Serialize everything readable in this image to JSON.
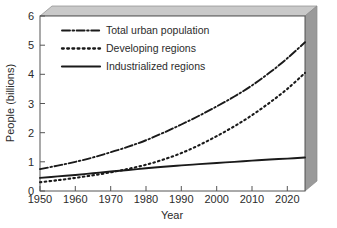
{
  "chart_data": {
    "type": "line",
    "title": "",
    "xlabel": "Year",
    "ylabel": "People (billions)",
    "xlim": [
      1950,
      2025
    ],
    "ylim": [
      0,
      6
    ],
    "xticks": [
      1950,
      1960,
      1970,
      1980,
      1990,
      2000,
      2010,
      2020
    ],
    "xtick_labels": [
      "1950",
      "1960",
      "1970",
      "1980",
      "1990",
      "2000",
      "2010",
      "2020"
    ],
    "yticks": [
      0,
      1,
      2,
      3,
      4,
      5,
      6
    ],
    "ytick_labels": [
      "0",
      "1",
      "2",
      "3",
      "4",
      "5",
      "6"
    ],
    "grid": false,
    "legend_position": "upper-left-inside",
    "x": [
      1950,
      1955,
      1960,
      1965,
      1970,
      1975,
      1980,
      1985,
      1990,
      1995,
      2000,
      2005,
      2010,
      2015,
      2020,
      2025
    ],
    "series": [
      {
        "name": "Total urban population",
        "style": "dash-dot",
        "color": "#1a1a1a",
        "values": [
          0.75,
          0.87,
          1.0,
          1.15,
          1.33,
          1.52,
          1.74,
          2.0,
          2.28,
          2.58,
          2.9,
          3.24,
          3.62,
          4.06,
          4.55,
          5.1
        ]
      },
      {
        "name": "Developing regions",
        "style": "dotted",
        "color": "#1a1a1a",
        "values": [
          0.3,
          0.37,
          0.45,
          0.54,
          0.64,
          0.76,
          0.9,
          1.08,
          1.3,
          1.57,
          1.88,
          2.22,
          2.6,
          3.03,
          3.5,
          4.05
        ]
      },
      {
        "name": "Industrialized regions",
        "style": "solid",
        "color": "#1a1a1a",
        "values": [
          0.45,
          0.5,
          0.55,
          0.61,
          0.67,
          0.72,
          0.78,
          0.83,
          0.88,
          0.92,
          0.96,
          1.0,
          1.04,
          1.08,
          1.11,
          1.15
        ]
      }
    ]
  },
  "legend": {
    "items": [
      {
        "label": "Total urban population"
      },
      {
        "label": "Developing regions"
      },
      {
        "label": "Industrialized regions"
      }
    ]
  },
  "axes": {
    "x_title": "Year",
    "y_title": "People (billions)"
  },
  "colors": {
    "line": "#1a1a1a",
    "axis": "#555555",
    "bevel_top": "#c9c9c9",
    "bevel_right": "#9a9a9a",
    "background": "#ffffff"
  }
}
